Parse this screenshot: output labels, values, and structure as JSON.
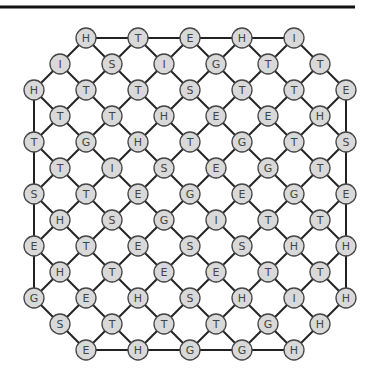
{
  "board": {
    "top_rule": {
      "x1": 0,
      "x2": 355,
      "y": 7
    },
    "spacing": 26,
    "x0": 34,
    "y0": 38,
    "node_radius": 10,
    "rows": [
      {
        "y": 38,
        "start_col": 2,
        "letters": [
          "H",
          "T",
          "E",
          "H",
          "I"
        ]
      },
      {
        "y": 64,
        "start_col": 1,
        "letters": [
          "I",
          "S",
          "I",
          "G",
          "T",
          "T"
        ]
      },
      {
        "y": 90,
        "start_col": 0,
        "letters": [
          "H",
          "T",
          "T",
          "S",
          "T",
          "T",
          "E"
        ]
      },
      {
        "y": 116,
        "start_col": 1,
        "letters": [
          "T",
          "T",
          "H",
          "E",
          "E",
          "H"
        ]
      },
      {
        "y": 142,
        "start_col": 0,
        "letters": [
          "T",
          "G",
          "H",
          "T",
          "G",
          "T",
          "S"
        ]
      },
      {
        "y": 168,
        "start_col": 1,
        "letters": [
          "T",
          "I",
          "S",
          "E",
          "G",
          "T"
        ]
      },
      {
        "y": 194,
        "start_col": 0,
        "letters": [
          "S",
          "T",
          "E",
          "G",
          "E",
          "G",
          "E"
        ]
      },
      {
        "y": 220,
        "start_col": 1,
        "letters": [
          "H",
          "S",
          "G",
          "I",
          "T",
          "T"
        ]
      },
      {
        "y": 246,
        "start_col": 0,
        "letters": [
          "E",
          "T",
          "E",
          "S",
          "S",
          "H",
          "H"
        ]
      },
      {
        "y": 272,
        "start_col": 1,
        "letters": [
          "H",
          "T",
          "E",
          "E",
          "T",
          "T"
        ]
      },
      {
        "y": 298,
        "start_col": 0,
        "letters": [
          "G",
          "E",
          "H",
          "S",
          "H",
          "I",
          "H"
        ]
      },
      {
        "y": 324,
        "start_col": 1,
        "letters": [
          "S",
          "T",
          "T",
          "T",
          "G",
          "H"
        ]
      },
      {
        "y": 350,
        "start_col": 2,
        "letters": [
          "E",
          "H",
          "G",
          "G",
          "H"
        ]
      }
    ],
    "colors": {
      "node_fill": "#d9d9d9",
      "node_stroke": "#444444",
      "edge": "#222222",
      "text": "#444444"
    }
  }
}
